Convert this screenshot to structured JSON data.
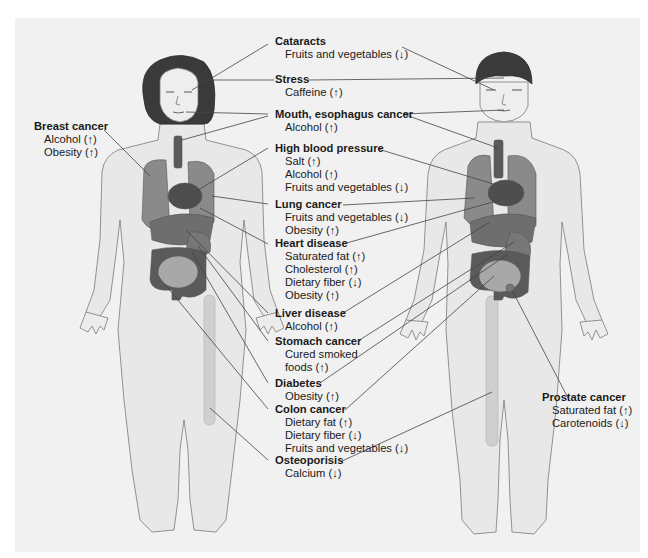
{
  "diagram": {
    "figures": [
      "woman",
      "man"
    ],
    "colors": {
      "panel_bg": "#f1f1f1",
      "skin_fill": "#e6e6e6",
      "outline": "#7a7a7a",
      "hair": "#3a3a3a",
      "organ_dark": "#5a5a5a",
      "organ_mid": "#8a8a8a",
      "leader_line": "#444444",
      "text": "#1a1a1a"
    },
    "labels": [
      {
        "id": "cataracts",
        "title": "Cataracts",
        "items": [
          "Fruits and vegetables (↓)"
        ]
      },
      {
        "id": "stress",
        "title": "Stress",
        "items": [
          "Caffeine (↑)"
        ]
      },
      {
        "id": "mouth",
        "title": "Mouth, esophagus cancer",
        "items": [
          "Alcohol (↑)"
        ]
      },
      {
        "id": "hbp",
        "title": "High blood pressure",
        "items": [
          "Salt (↑)",
          "Alcohol (↑)",
          "Fruits and vegetables (↓)"
        ]
      },
      {
        "id": "lung",
        "title": "Lung cancer",
        "items": [
          "Fruits and vegetables (↓)",
          "Obesity (↑)"
        ]
      },
      {
        "id": "heart",
        "title": "Heart disease",
        "items": [
          "Saturated fat (↑)",
          "Cholesterol (↑)",
          "Dietary fiber (↓)",
          "Obesity (↑)"
        ]
      },
      {
        "id": "liver",
        "title": "Liver disease",
        "items": [
          "Alcohol (↑)"
        ]
      },
      {
        "id": "stomach",
        "title": "Stomach cancer",
        "items": [
          "Cured smoked",
          "foods (↑)"
        ]
      },
      {
        "id": "diabetes",
        "title": "Diabetes",
        "items": [
          "Obesity (↑)"
        ]
      },
      {
        "id": "colon",
        "title": "Colon cancer",
        "items": [
          "Dietary fat (↑)",
          "Dietary fiber (↓)",
          "Fruits and vegetables (↓)"
        ]
      },
      {
        "id": "osteo",
        "title": "Osteoporisis",
        "items": [
          "Calcium (↓)"
        ]
      },
      {
        "id": "breast",
        "title": "Breast cancer",
        "items": [
          "Alcohol (↑)",
          "Obesity (↑)"
        ]
      },
      {
        "id": "prostate",
        "title": "Prostate cancer",
        "items": [
          "Saturated fat (↑)",
          "Carotenoids (↓)"
        ]
      }
    ]
  }
}
